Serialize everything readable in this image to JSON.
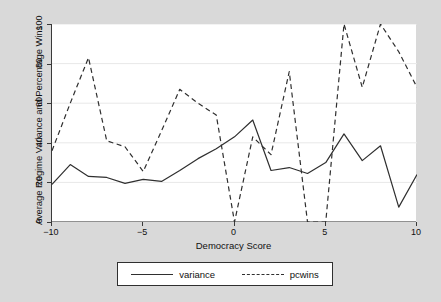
{
  "chart_data": {
    "type": "line",
    "title": "",
    "xlabel": "Democracy Score",
    "ylabel": "Average Regime Variance and Percentage Wins",
    "xlim": [
      -10,
      10
    ],
    "ylim": [
      0,
      100
    ],
    "xticks": [
      -10,
      -5,
      0,
      5,
      10
    ],
    "xtick_labels": [
      "−10",
      "−5",
      "0",
      "5",
      "10"
    ],
    "yticks": [
      0,
      20,
      40,
      60,
      80,
      100
    ],
    "ytick_labels": [
      "0",
      "20",
      "40",
      "60",
      "80",
      "100"
    ],
    "grid": "horizontal",
    "legend_position": "bottom",
    "background_color": "#d9d9d9",
    "plot_background_color": "#ffffff",
    "gridline_color": "#e8e8e8",
    "axis_color": "#3a3a3a",
    "x": [
      -10,
      -9,
      -8,
      -7,
      -6,
      -5,
      -4,
      -3,
      -2,
      -1,
      0,
      1,
      2,
      3,
      4,
      5,
      6,
      7,
      8,
      9,
      10
    ],
    "series": [
      {
        "name": "variance",
        "style": "solid",
        "color": "#2f2f2f",
        "values": [
          19,
          29,
          23,
          22.5,
          19.5,
          21.5,
          20.5,
          26,
          32,
          37,
          43,
          51.5,
          26,
          27.5,
          24.5,
          30,
          44.5,
          31,
          38.5,
          7.5,
          24
        ]
      },
      {
        "name": "pcwins",
        "style": "dashed",
        "color": "#2f2f2f",
        "values": [
          36,
          60,
          83,
          41,
          38,
          25.5,
          46,
          67,
          60,
          54,
          0,
          43,
          34,
          76,
          0,
          0,
          100,
          68,
          100,
          86,
          68
        ]
      }
    ]
  },
  "legend": {
    "items": [
      {
        "label": "variance",
        "style": "solid"
      },
      {
        "label": "pcwins",
        "style": "dashed"
      }
    ]
  }
}
